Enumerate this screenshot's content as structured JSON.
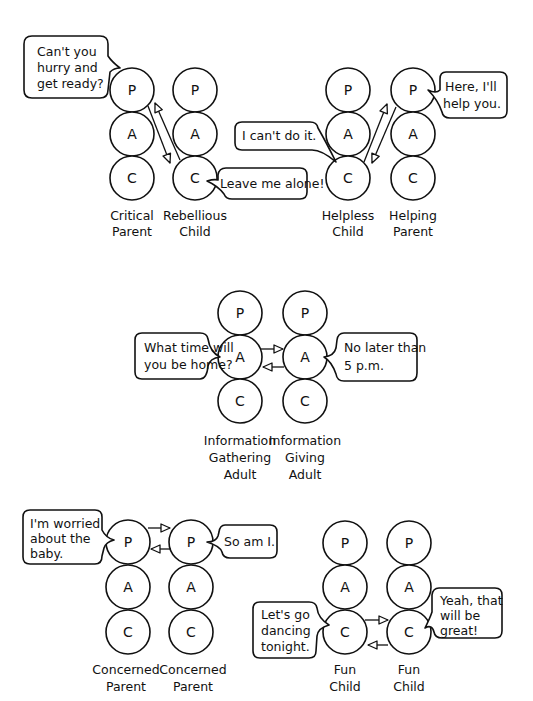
{
  "diagram": {
    "type": "transactional-analysis-ego-states",
    "ego_state_letters": [
      "P",
      "A",
      "C"
    ],
    "transactions": [
      {
        "name": "crossed-transaction-critical-rebellious",
        "left_person": {
          "label_line1": "Critical",
          "label_line2": "Parent",
          "speech": [
            "Can't you",
            "hurry and",
            "get ready?"
          ]
        },
        "right_person": {
          "label_line1": "Rebellious",
          "label_line2": "Child",
          "speech": [
            "Leave me alone!"
          ]
        }
      },
      {
        "name": "complementary-transaction-helpless-helping",
        "left_person": {
          "label_line1": "Helpless",
          "label_line2": "Child",
          "speech": [
            "I can't do it."
          ]
        },
        "right_person": {
          "label_line1": "Helping",
          "label_line2": "Parent",
          "speech": [
            "Here, I'll",
            "help you."
          ]
        }
      },
      {
        "name": "adult-adult-transaction",
        "left_person": {
          "label_line1": "Information",
          "label_line2": "Gathering",
          "label_line3": "Adult",
          "speech": [
            "What time will",
            "you be home?"
          ]
        },
        "right_person": {
          "label_line1": "Information",
          "label_line2": "Giving",
          "label_line3": "Adult",
          "speech": [
            "No later than",
            "5 p.m."
          ]
        }
      },
      {
        "name": "parent-parent-transaction",
        "left_person": {
          "label_line1": "Concerned",
          "label_line2": "Parent",
          "speech": [
            "I'm worried",
            "about the",
            "baby."
          ]
        },
        "right_person": {
          "label_line1": "Concerned",
          "label_line2": "Parent",
          "speech": [
            "So am I."
          ]
        }
      },
      {
        "name": "child-child-transaction",
        "left_person": {
          "label_line1": "Fun",
          "label_line2": "Child",
          "speech": [
            "Let's go",
            "dancing",
            "tonight."
          ]
        },
        "right_person": {
          "label_line1": "Fun",
          "label_line2": "Child",
          "speech": [
            "Yeah, that",
            "will be",
            "great!"
          ]
        }
      }
    ]
  }
}
